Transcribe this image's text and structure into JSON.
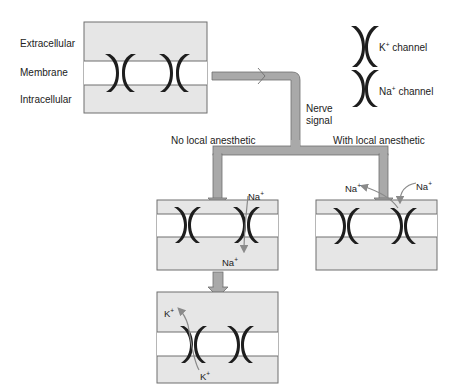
{
  "diagram": {
    "region_labels": {
      "extracellular": "Extracellular",
      "membrane": "Membrane",
      "intracellular": "Intracellular"
    },
    "legend": {
      "k_channel": {
        "ion": "K",
        "charge": "+",
        "label": "channel"
      },
      "na_channel": {
        "ion": "Na",
        "charge": "+",
        "label": "channel"
      }
    },
    "signal_label_line1": "Nerve",
    "signal_label_line2": "signal",
    "branches": {
      "left": "No local anesthetic",
      "right": "With local anesthetic"
    },
    "ions": {
      "na_left_top": {
        "ion": "Na",
        "charge": "+"
      },
      "na_left_bottom": {
        "ion": "Na",
        "charge": "+"
      },
      "na_right_a": {
        "ion": "Na",
        "charge": "+"
      },
      "na_right_b": {
        "ion": "Na",
        "charge": "+"
      },
      "k_top": {
        "ion": "K",
        "charge": "+"
      },
      "k_bottom": {
        "ion": "K",
        "charge": "+"
      }
    },
    "colors": {
      "fluid": "#e6e6e6",
      "membrane": "#ffffff",
      "border": "#6f6f6f",
      "channel": "#1e1e1e",
      "arrow_fill": "#a9a9a9",
      "ion_arrow": "#8a8a8a"
    }
  }
}
